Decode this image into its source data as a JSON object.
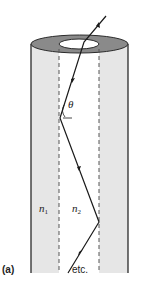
{
  "figure": {
    "panel_label": "(a)",
    "angle_label": "θ",
    "cladding_label": {
      "symbol": "n",
      "subscript": "1"
    },
    "core_label": {
      "symbol": "n",
      "subscript": "2"
    },
    "continuation_label": "etc."
  },
  "colors": {
    "cladding_fill": "#e6e6e6",
    "cladding_top": "#8a8a8a",
    "core_fill": "#ffffff",
    "outline": "#2a2a2a",
    "ray": "#1a1a1a"
  },
  "geometry": {
    "outer_cylinder": {
      "left": 31,
      "right": 128,
      "top_center_y": 44,
      "top_ry": 9,
      "bottom_y": 273
    },
    "inner_core": {
      "left": 59,
      "right": 99,
      "top_center_y": 44,
      "top_ry": 5
    },
    "ray_points": [
      [
        106,
        16
      ],
      [
        84,
        42
      ],
      [
        60,
        118
      ],
      [
        99,
        222
      ],
      [
        68,
        273
      ]
    ]
  }
}
